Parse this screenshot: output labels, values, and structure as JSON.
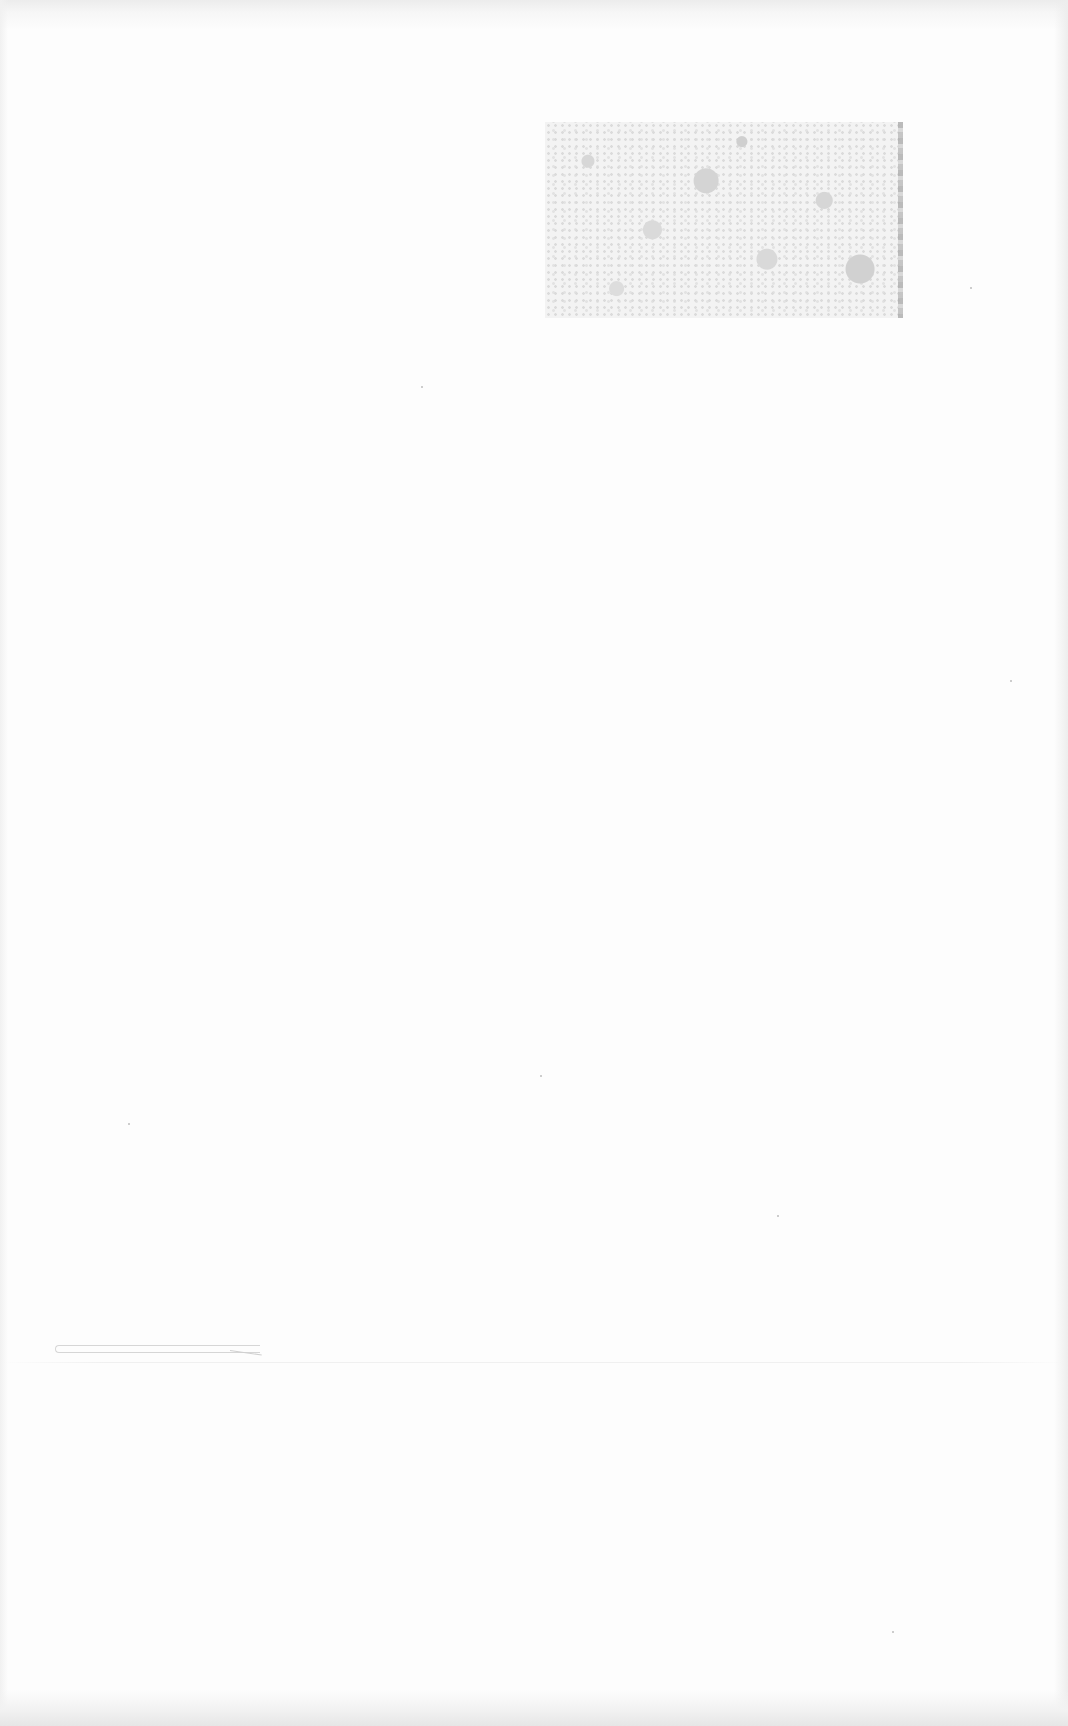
{
  "page": {
    "type": "scanned-blank-page",
    "background_color": "#fdfdfd",
    "text_content": []
  },
  "elements": {
    "faded_plate": {
      "description": "faded speckled photograph/plate region, no legible content",
      "color": "#d4d4d4"
    },
    "pen_stroke": {
      "description": "faint hand-drawn horizontal stroke",
      "color": "#d6d6d6"
    }
  }
}
